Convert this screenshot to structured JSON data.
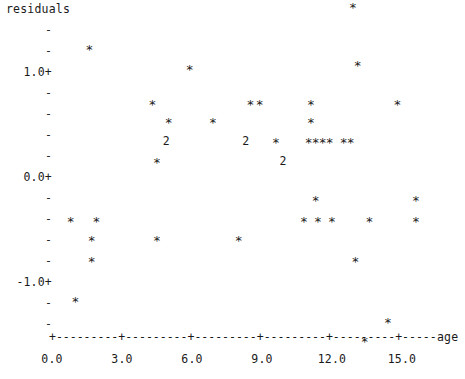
{
  "chart_data": {
    "type": "scatter",
    "title": "",
    "ylabel": "residuals",
    "xlabel": "age",
    "plot_style": "character-plot",
    "grid": false,
    "legend": null,
    "xlim": [
      0.0,
      16.6
    ],
    "ylim": [
      -1.6,
      1.8
    ],
    "x_ticks": [
      "0.0",
      "3.0",
      "6.0",
      "9.0",
      "12.0",
      "15.0"
    ],
    "x_tick_values": [
      0.0,
      3.0,
      6.0,
      9.0,
      12.0,
      15.0
    ],
    "y_ticks": [
      "1.0+",
      "0.0+",
      "-1.0+"
    ],
    "y_tick_values": [
      1.0,
      0.0,
      -1.0
    ],
    "y_minor_ticks": [
      "-",
      "-",
      "-",
      "-",
      "-",
      "-",
      "-",
      "-",
      "-",
      "-",
      "-",
      "-",
      "-"
    ],
    "symbols": {
      "single": "*",
      "double": "2"
    },
    "note": "Each '*' is one observation; '2' marks two overlapping observations.",
    "points": [
      {
        "x": 12.9,
        "y": 1.62,
        "symbol": "*",
        "count": 1
      },
      {
        "x": 1.6,
        "y": 1.22,
        "symbol": "*",
        "count": 1
      },
      {
        "x": 13.1,
        "y": 1.07,
        "symbol": "*",
        "count": 1
      },
      {
        "x": 5.9,
        "y": 1.03,
        "symbol": "*",
        "count": 1
      },
      {
        "x": 4.3,
        "y": 0.7,
        "symbol": "*",
        "count": 1
      },
      {
        "x": 8.5,
        "y": 0.7,
        "symbol": "*",
        "count": 1
      },
      {
        "x": 8.9,
        "y": 0.7,
        "symbol": "*",
        "count": 1
      },
      {
        "x": 11.1,
        "y": 0.7,
        "symbol": "*",
        "count": 1
      },
      {
        "x": 14.8,
        "y": 0.7,
        "symbol": "*",
        "count": 1
      },
      {
        "x": 5.0,
        "y": 0.52,
        "symbol": "*",
        "count": 1
      },
      {
        "x": 6.9,
        "y": 0.52,
        "symbol": "*",
        "count": 1
      },
      {
        "x": 11.1,
        "y": 0.52,
        "symbol": "*",
        "count": 1
      },
      {
        "x": 4.9,
        "y": 0.33,
        "symbol": "2",
        "count": 2
      },
      {
        "x": 8.3,
        "y": 0.33,
        "symbol": "2",
        "count": 2
      },
      {
        "x": 9.6,
        "y": 0.33,
        "symbol": "*",
        "count": 1
      },
      {
        "x": 11.0,
        "y": 0.33,
        "symbol": "*",
        "count": 1
      },
      {
        "x": 11.3,
        "y": 0.33,
        "symbol": "*",
        "count": 1
      },
      {
        "x": 11.6,
        "y": 0.33,
        "symbol": "*",
        "count": 1
      },
      {
        "x": 11.9,
        "y": 0.33,
        "symbol": "*",
        "count": 1
      },
      {
        "x": 12.5,
        "y": 0.33,
        "symbol": "*",
        "count": 1
      },
      {
        "x": 12.8,
        "y": 0.33,
        "symbol": "*",
        "count": 1
      },
      {
        "x": 4.5,
        "y": 0.14,
        "symbol": "*",
        "count": 1
      },
      {
        "x": 9.9,
        "y": 0.14,
        "symbol": "2",
        "count": 2
      },
      {
        "x": 11.3,
        "y": -0.22,
        "symbol": "*",
        "count": 1
      },
      {
        "x": 15.6,
        "y": -0.22,
        "symbol": "*",
        "count": 1
      },
      {
        "x": 0.8,
        "y": -0.42,
        "symbol": "*",
        "count": 1
      },
      {
        "x": 1.9,
        "y": -0.42,
        "symbol": "*",
        "count": 1
      },
      {
        "x": 10.8,
        "y": -0.42,
        "symbol": "*",
        "count": 1
      },
      {
        "x": 11.4,
        "y": -0.42,
        "symbol": "*",
        "count": 1
      },
      {
        "x": 12.0,
        "y": -0.42,
        "symbol": "*",
        "count": 1
      },
      {
        "x": 13.6,
        "y": -0.42,
        "symbol": "*",
        "count": 1
      },
      {
        "x": 15.6,
        "y": -0.42,
        "symbol": "*",
        "count": 1
      },
      {
        "x": 1.7,
        "y": -0.6,
        "symbol": "*",
        "count": 1
      },
      {
        "x": 4.5,
        "y": -0.6,
        "symbol": "*",
        "count": 1
      },
      {
        "x": 8.0,
        "y": -0.6,
        "symbol": "*",
        "count": 1
      },
      {
        "x": 1.7,
        "y": -0.8,
        "symbol": "*",
        "count": 1
      },
      {
        "x": 13.0,
        "y": -0.8,
        "symbol": "*",
        "count": 1
      },
      {
        "x": 1.0,
        "y": -1.18,
        "symbol": "*",
        "count": 1
      },
      {
        "x": 14.4,
        "y": -1.38,
        "symbol": "*",
        "count": 1
      },
      {
        "x": 13.4,
        "y": -1.56,
        "symbol": "*",
        "count": 1
      }
    ]
  },
  "axis": {
    "axis_line": "+---------+---------+---------+---------+---------+------",
    "x_title": "age",
    "y_title": "residuals"
  }
}
